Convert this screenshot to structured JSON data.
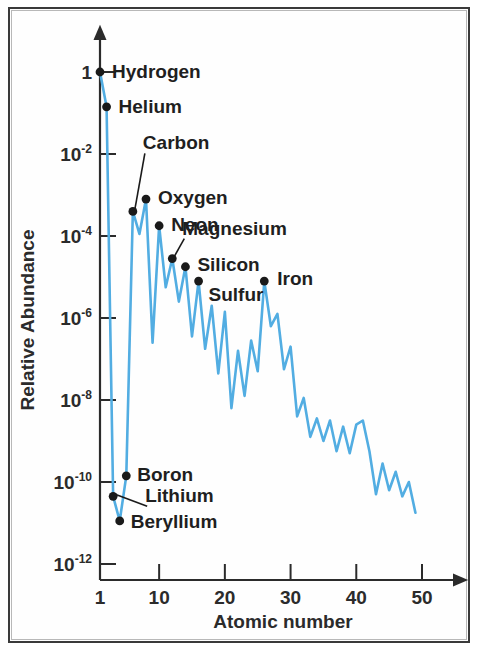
{
  "figure": {
    "title": "",
    "line_color": "#52ade2",
    "marker_color": "#1a1a1a",
    "axis_color": "#2b2b2b",
    "background": "#ffffff",
    "border_color": "#3a3a3a"
  },
  "chart_data": {
    "type": "line",
    "title": "",
    "subtitle": "",
    "xlabel": "Atomic number",
    "ylabel": "Relative Abundance",
    "xlim": [
      1,
      53
    ],
    "ylim_exponents": [
      -13,
      0.6
    ],
    "yscale": "log",
    "grid": false,
    "legend_position": "none",
    "xticks": [
      1,
      10,
      20,
      30,
      40,
      50
    ],
    "xticklabels": [
      "1",
      "10",
      "20",
      "30",
      "40",
      "50"
    ],
    "yticks_exponents": [
      0,
      -2,
      -4,
      -6,
      -8,
      -10,
      -12
    ],
    "yticklabels": [
      "1",
      "10-2",
      "10-4",
      "10-6",
      "10-8",
      "10-10",
      "10-12"
    ],
    "yticklabels_formatted": [
      {
        "base": "1",
        "exp": ""
      },
      {
        "base": "10",
        "exp": "-2"
      },
      {
        "base": "10",
        "exp": "-4"
      },
      {
        "base": "10",
        "exp": "-6"
      },
      {
        "base": "10",
        "exp": "-8"
      },
      {
        "base": "10",
        "exp": "-10"
      },
      {
        "base": "10",
        "exp": "-12"
      }
    ],
    "x": [
      1,
      2,
      3,
      4,
      5,
      6,
      7,
      8,
      9,
      10,
      11,
      12,
      13,
      14,
      15,
      16,
      17,
      18,
      19,
      20,
      21,
      22,
      23,
      24,
      25,
      26,
      27,
      28,
      29,
      30,
      31,
      32,
      33,
      34,
      35,
      36,
      37,
      38,
      39,
      40,
      41,
      42,
      43,
      44,
      45,
      46,
      47,
      48,
      49
    ],
    "log10_values": [
      0,
      -0.85,
      -10.35,
      -10.95,
      -9.85,
      -3.4,
      -3.95,
      -3.1,
      -6.6,
      -3.75,
      -5.25,
      -4.55,
      -5.6,
      -4.75,
      -6.45,
      -5.1,
      -6.75,
      -5.7,
      -7.35,
      -5.85,
      -8.2,
      -6.8,
      -7.9,
      -6.55,
      -7.3,
      -5.1,
      -6.2,
      -5.9,
      -7.25,
      -6.7,
      -8.4,
      -7.95,
      -8.9,
      -8.45,
      -9.0,
      -8.5,
      -9.25,
      -8.65,
      -9.3,
      -8.6,
      -8.5,
      -9.25,
      -10.3,
      -9.55,
      -10.2,
      -9.75,
      -10.35,
      -10.0,
      -10.75
    ],
    "values": [
      1,
      0.14,
      4.5e-11,
      1.1e-11,
      1.4e-10,
      0.0004,
      0.00011,
      0.00079,
      2.5e-07,
      0.00018,
      5.6e-06,
      2.8e-05,
      2.5e-06,
      1.8e-05,
      3.5e-07,
      7.9e-06,
      1.8e-07,
      2e-06,
      4.5e-08,
      1.4e-06,
      6.3e-09,
      1.6e-07,
      1.3e-08,
      2.8e-07,
      5e-08,
      7.9e-06,
      6.3e-07,
      1.3e-06,
      5.6e-08,
      2e-07,
      4e-09,
      1.1e-08,
      1.3e-09,
      3.5e-09,
      1e-09,
      3.2e-09,
      5.6e-10,
      2.2e-09,
      5e-10,
      2.5e-09,
      3.2e-09,
      5.6e-10,
      5e-11,
      2.8e-10,
      6.3e-11,
      1.8e-10,
      4.5e-11,
      1e-10,
      1.8e-11
    ],
    "annotations": [
      {
        "label": "Hydrogen",
        "x": 1,
        "log10_value": 0,
        "label_dx": 12,
        "label_dy": 6,
        "leader": false
      },
      {
        "label": "Helium",
        "x": 2,
        "log10_value": -0.85,
        "label_dx": 12,
        "label_dy": 6,
        "leader": false
      },
      {
        "label": "Carbon",
        "x": 6,
        "log10_value": -3.4,
        "label_dx": 10,
        "label_dy": -62,
        "leader": true
      },
      {
        "label": "Oxygen",
        "x": 8,
        "log10_value": -3.1,
        "label_dx": 12,
        "label_dy": 5,
        "leader": false
      },
      {
        "label": "Neon",
        "x": 10,
        "log10_value": -3.75,
        "label_dx": 12,
        "label_dy": 5,
        "leader": false
      },
      {
        "label": "Magnesium",
        "x": 12,
        "log10_value": -4.55,
        "label_dx": 10,
        "label_dy": -24,
        "leader": true
      },
      {
        "label": "Silicon",
        "x": 14,
        "log10_value": -4.75,
        "label_dx": 12,
        "label_dy": 4,
        "leader": false
      },
      {
        "label": "Sulfur",
        "x": 16,
        "log10_value": -5.1,
        "label_dx": 10,
        "label_dy": 20,
        "leader": false
      },
      {
        "label": "Iron",
        "x": 26,
        "log10_value": -5.1,
        "label_dx": 13,
        "label_dy": 4,
        "leader": false
      },
      {
        "label": "Boron",
        "x": 5,
        "log10_value": -9.85,
        "label_dx": 11,
        "label_dy": 5,
        "leader": false
      },
      {
        "label": "Lithium",
        "x": 3,
        "log10_value": -10.35,
        "label_dx": 32,
        "label_dy": 6,
        "leader": true
      },
      {
        "label": "Beryllium",
        "x": 4,
        "log10_value": -10.95,
        "label_dx": 11,
        "label_dy": 7,
        "leader": false
      }
    ]
  }
}
